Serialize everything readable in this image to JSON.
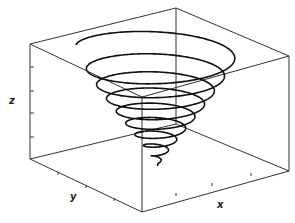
{
  "figure": {
    "type": "3d-parametric-curve",
    "axes": {
      "x_label": "x",
      "y_label": "y",
      "z_label": "z"
    },
    "colors": {
      "curve": "#111111",
      "box": "#333333",
      "background": "#ffffff"
    },
    "box_corners_px": {
      "top_left": [
        30,
        44
      ],
      "top_back": [
        176,
        8
      ],
      "top_right": [
        289,
        56
      ],
      "top_front": [
        142,
        97
      ],
      "bottom_left": [
        30,
        159
      ],
      "bottom_back": [
        176,
        124
      ],
      "bottom_right": [
        289,
        171
      ],
      "bottom_front": [
        142,
        212
      ]
    },
    "z_ticks_px": [
      67,
      91,
      113,
      137
    ],
    "spiral": {
      "center_x": 158,
      "top_y": 45,
      "apex_y": 166,
      "max_radius_x": 82,
      "max_radius_y": 22,
      "turns": 9
    }
  }
}
